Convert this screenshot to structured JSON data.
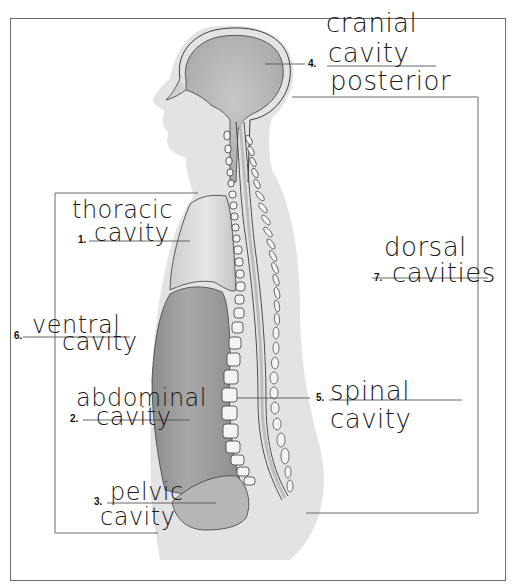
{
  "diagram": {
    "labels": [
      {
        "number": "1.",
        "answer_lines": [
          "thoracic",
          "cavity"
        ]
      },
      {
        "number": "2.",
        "answer_lines": [
          "abdominal",
          "cavity"
        ]
      },
      {
        "number": "3.",
        "answer_lines": [
          "pelvic",
          "cavity"
        ]
      },
      {
        "number": "4.",
        "answer_lines": [
          "cranial",
          "cavity",
          "posterior"
        ]
      },
      {
        "number": "5.",
        "answer_lines": [
          "spinal",
          "cavity"
        ]
      },
      {
        "number": "6.",
        "answer_lines": [
          "ventral",
          "cavity"
        ]
      },
      {
        "number": "7.",
        "answer_lines": [
          "dorsal",
          "cavities"
        ]
      }
    ],
    "colors": {
      "body_silhouette": "#e3e3e3",
      "brain": "#b9b9b9",
      "thoracic": "#d2d2d2",
      "abdominal": "#9a9a9a",
      "pelvic": "#b6b6b6",
      "outline": "#3c3c3c",
      "bracket": "#6a6a6a",
      "ink": "#1a1a1a"
    }
  }
}
